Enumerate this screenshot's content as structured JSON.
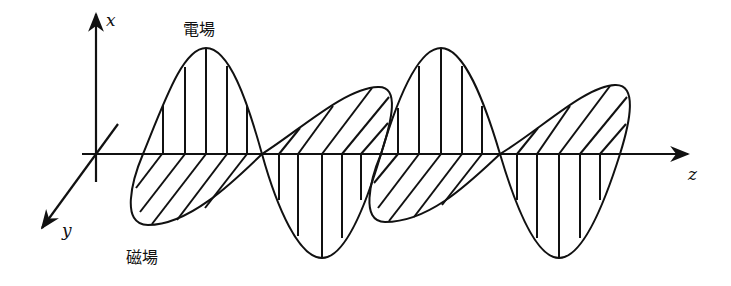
{
  "diagram": {
    "title": "",
    "type": "electromagnetic-wave",
    "axes": {
      "x": {
        "label": "x"
      },
      "y": {
        "label": "y"
      },
      "z": {
        "label": "z"
      }
    },
    "fields": {
      "electric": {
        "label": "電場",
        "hatch": "vertical",
        "plane": "x-z"
      },
      "magnetic": {
        "label": "磁場",
        "hatch": "diagonal",
        "plane": "y-z"
      }
    },
    "colors": {
      "line": "#111111",
      "background": "#ffffff"
    }
  }
}
